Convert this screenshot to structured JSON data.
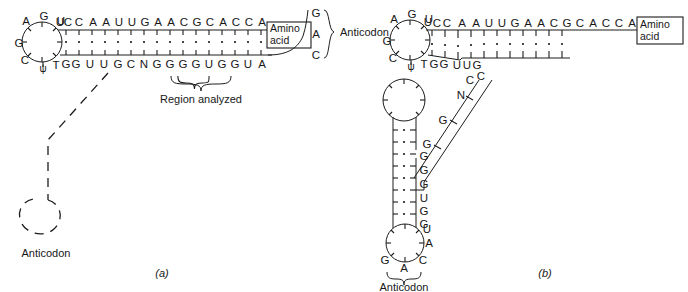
{
  "figure": {
    "title_absent": true,
    "panels": [
      {
        "id": "a",
        "label": "(a)",
        "name": "cloverleaf-partial",
        "acceptor_stem_top": [
          "U",
          "C",
          "C",
          "A",
          "A",
          "U",
          "U",
          "G",
          "A",
          "A",
          "C",
          "G",
          "C",
          "A",
          "C",
          "C",
          "A"
        ],
        "acceptor_stem_bottom": [
          "T",
          "G",
          "G",
          "U",
          "U",
          "G",
          "C",
          "N",
          "G",
          "G",
          "G",
          "G",
          "U",
          "G",
          "G",
          "U",
          "A"
        ],
        "tpsic_loop_bases": [
          "A",
          "G",
          "U",
          "C",
          "ψ",
          "G"
        ],
        "acceptor_end_bases": [
          "G",
          "A",
          "C"
        ],
        "amino_acid_box": [
          "Amino",
          "acid"
        ],
        "anticodon_label": "Anticodon",
        "region_label": "Region analyzed",
        "lower_anticodon_label": "Anticodon"
      },
      {
        "id": "b",
        "label": "(b)",
        "name": "cloverleaf-full",
        "acceptor_stem_top": [
          "U",
          "C",
          "C",
          "A",
          "A",
          "U",
          "U",
          "G",
          "A",
          "A",
          "C",
          "G",
          "C",
          "A",
          "C",
          "C",
          "A"
        ],
        "acceptor_stem_bottom": [
          "T",
          "G",
          "G",
          "U",
          "U",
          "G",
          "C"
        ],
        "tpsic_loop_bases": [
          "A",
          "G",
          "U",
          "C",
          "ψ",
          "G"
        ],
        "diagonal_bases": [
          "C",
          "N",
          "G",
          "G"
        ],
        "anticodon_stem_bases": [
          "G",
          "G",
          "G",
          "U",
          "G",
          "G"
        ],
        "anticodon_loop_bases": [
          "U",
          "A",
          "C",
          "A",
          "G"
        ],
        "amino_acid_box": [
          "Amino",
          "acid"
        ],
        "anticodon_label": "Anticodon"
      }
    ],
    "colors": {
      "ink": "#1c1c1c",
      "background": "#ffffff"
    }
  }
}
